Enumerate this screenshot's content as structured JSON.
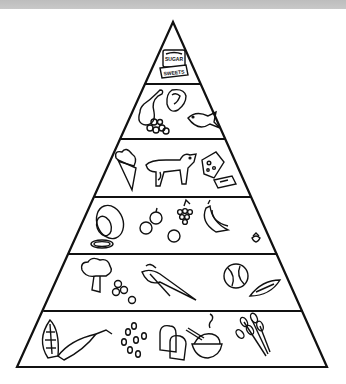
{
  "diagram": {
    "type": "food-pyramid",
    "style": "black line-art coloring page",
    "colors": {
      "ink": "#111111",
      "background": "#ffffff",
      "top_band": "#c4c4c4"
    },
    "tiers": [
      {
        "level": 1,
        "position": "apex",
        "group": "sweets",
        "items": [
          "sugar-box",
          "sweets-package"
        ],
        "labels": {
          "box_top": "SUGAR",
          "box_front": "SWEETS"
        }
      },
      {
        "level": 2,
        "group": "meat-fish",
        "items": [
          "chicken-drumstick",
          "steak",
          "nuts",
          "fish"
        ]
      },
      {
        "level": 3,
        "group": "dairy",
        "items": [
          "ice-cream-cone",
          "cow",
          "cheese",
          "butter"
        ]
      },
      {
        "level": 4,
        "group": "fruit",
        "items": [
          "melon",
          "melon-slice",
          "apples",
          "grapes",
          "orange",
          "bananas",
          "strawberry"
        ]
      },
      {
        "level": 5,
        "group": "vegetables",
        "items": [
          "broccoli",
          "peas",
          "carrots",
          "cabbage",
          "peapod"
        ]
      },
      {
        "level": 6,
        "position": "base",
        "group": "grains",
        "items": [
          "corn",
          "beans",
          "bread",
          "rice-bowl",
          "wheat"
        ]
      }
    ]
  }
}
